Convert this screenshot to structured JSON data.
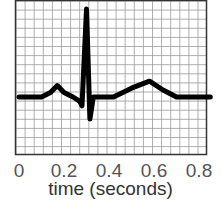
{
  "chart_data": {
    "type": "line",
    "title": "",
    "xlabel": "time (seconds)",
    "ylabel": "",
    "xlim": [
      0,
      0.85
    ],
    "x_ticks": [
      "0",
      "0.2",
      "0.4",
      "0.6",
      "0.8"
    ],
    "grid": true,
    "legend": null,
    "series": [
      {
        "name": "ECG",
        "description": "Single heartbeat ECG trace: P wave ~0.17s, QRS complex ~0.28-0.33s with sharp R peak ~0.30s, T wave ~0.58s",
        "x": [
          0.0,
          0.1,
          0.14,
          0.17,
          0.2,
          0.24,
          0.27,
          0.28,
          0.3,
          0.315,
          0.33,
          0.35,
          0.42,
          0.5,
          0.58,
          0.64,
          0.7,
          0.85
        ],
        "y": [
          0.0,
          0.0,
          0.05,
          0.13,
          0.05,
          0.0,
          -0.05,
          -0.1,
          1.0,
          -0.25,
          0.0,
          0.0,
          0.0,
          0.1,
          0.18,
          0.08,
          0.0,
          0.0
        ]
      }
    ]
  },
  "axis": {
    "tick_labels": [
      "0",
      "0.2",
      "0.4",
      "0.6",
      "0.8"
    ],
    "xlabel": "time (seconds)"
  }
}
